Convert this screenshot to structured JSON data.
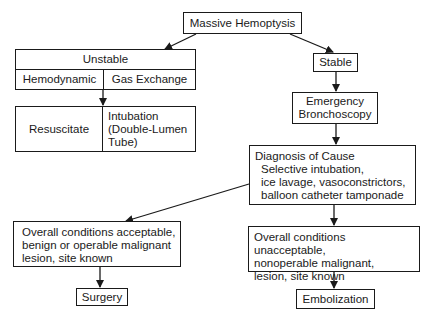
{
  "diagram": {
    "type": "flowchart",
    "nodes": {
      "root": {
        "label": "Massive Hemoptysis"
      },
      "unstable": {
        "label": "Unstable",
        "left": "Hemodynamic",
        "right": "Gas Exchange"
      },
      "unstable_actions": {
        "left": "Resuscitate",
        "right": "Intubation\n(Double-Lumen\nTube)"
      },
      "stable": {
        "label": "Stable"
      },
      "bronchoscopy": {
        "label": "Emergency\nBronchoscopy"
      },
      "diagnosis": {
        "title": "Diagnosis of Cause",
        "body": "Selective intubation,\nice lavage, vasoconstrictors,\nballoon catheter tamponade"
      },
      "acceptable": {
        "label": "Overall conditions acceptable,\nbenign or operable malignant\nlesion, site known"
      },
      "surgery": {
        "label": "Surgery"
      },
      "unacceptable": {
        "label": "Overall conditions unacceptable,\nnonoperable malignant,\nlesion, site known"
      },
      "embolization": {
        "label": "Embolization"
      }
    },
    "edges": [
      [
        "Massive Hemoptysis",
        "Unstable"
      ],
      [
        "Massive Hemoptysis",
        "Stable"
      ],
      [
        "Unstable",
        "Resuscitate / Intubation"
      ],
      [
        "Stable",
        "Emergency Bronchoscopy"
      ],
      [
        "Emergency Bronchoscopy",
        "Diagnosis of Cause"
      ],
      [
        "Diagnosis of Cause",
        "Overall conditions acceptable"
      ],
      [
        "Diagnosis of Cause",
        "Overall conditions unacceptable"
      ],
      [
        "Overall conditions acceptable",
        "Surgery"
      ],
      [
        "Overall conditions unacceptable",
        "Embolization"
      ]
    ]
  }
}
